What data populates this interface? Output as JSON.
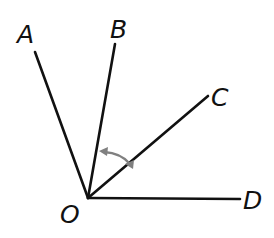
{
  "diagram": {
    "type": "geometry-angles",
    "vertex": {
      "label": "O",
      "x": 88,
      "y": 198
    },
    "rays": [
      {
        "name": "OA",
        "endpoint_label": "A",
        "x2": 35,
        "y2": 52
      },
      {
        "name": "OB",
        "endpoint_label": "B",
        "x2": 115,
        "y2": 44
      },
      {
        "name": "OC",
        "endpoint_label": "C",
        "x2": 208,
        "y2": 96
      },
      {
        "name": "OD",
        "endpoint_label": "D",
        "x2": 240,
        "y2": 199
      }
    ],
    "labels": {
      "A": "A",
      "B": "B",
      "C": "C",
      "D": "D",
      "O": "O"
    },
    "marked_angle": {
      "name": "angle BOC",
      "between": [
        "OB",
        "OC"
      ],
      "style": "double-headed arc arrow",
      "color": "#808080"
    },
    "colors": {
      "lines": "#111111",
      "arc": "#808080",
      "background": "#ffffff"
    }
  }
}
